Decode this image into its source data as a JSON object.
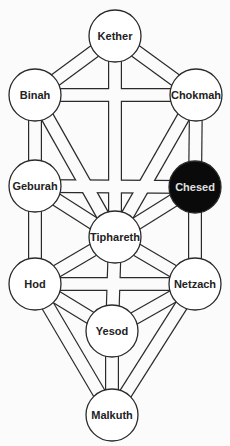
{
  "diagram": {
    "colors": {
      "background": "#fbfbfb",
      "stroke": "#2a2a2a",
      "node_fill": "#ffffff",
      "highlight_fill": "#0a0a0a",
      "highlight_text": "#e0e0e0",
      "text": "#222222"
    },
    "nodes": [
      {
        "id": "kether",
        "label": "Kether",
        "x": 115,
        "y": 36,
        "highlighted": false
      },
      {
        "id": "binah",
        "label": "Binah",
        "x": 35,
        "y": 95,
        "highlighted": false
      },
      {
        "id": "chokmah",
        "label": "Chokmah",
        "x": 196,
        "y": 95,
        "highlighted": false
      },
      {
        "id": "geburah",
        "label": "Geburah",
        "x": 35,
        "y": 186,
        "highlighted": false
      },
      {
        "id": "chesed",
        "label": "Chesed",
        "x": 195,
        "y": 187,
        "highlighted": true
      },
      {
        "id": "tiphareth",
        "label": "Tiphareth",
        "x": 115,
        "y": 237,
        "highlighted": false
      },
      {
        "id": "hod",
        "label": "Hod",
        "x": 35,
        "y": 284,
        "highlighted": false
      },
      {
        "id": "netzach",
        "label": "Netzach",
        "x": 195,
        "y": 284,
        "highlighted": false
      },
      {
        "id": "yesod",
        "label": "Yesod",
        "x": 112,
        "y": 331,
        "highlighted": false
      },
      {
        "id": "malkuth",
        "label": "Malkuth",
        "x": 112,
        "y": 415,
        "highlighted": false
      }
    ],
    "paths": [
      [
        "kether",
        "binah"
      ],
      [
        "kether",
        "chokmah"
      ],
      [
        "kether",
        "tiphareth"
      ],
      [
        "binah",
        "chokmah"
      ],
      [
        "binah",
        "geburah"
      ],
      [
        "binah",
        "tiphareth"
      ],
      [
        "chokmah",
        "chesed"
      ],
      [
        "chokmah",
        "tiphareth"
      ],
      [
        "geburah",
        "chesed"
      ],
      [
        "geburah",
        "tiphareth"
      ],
      [
        "geburah",
        "hod"
      ],
      [
        "chesed",
        "tiphareth"
      ],
      [
        "chesed",
        "netzach"
      ],
      [
        "tiphareth",
        "hod"
      ],
      [
        "tiphareth",
        "netzach"
      ],
      [
        "tiphareth",
        "yesod"
      ],
      [
        "hod",
        "netzach"
      ],
      [
        "hod",
        "yesod"
      ],
      [
        "hod",
        "malkuth"
      ],
      [
        "netzach",
        "yesod"
      ],
      [
        "netzach",
        "malkuth"
      ],
      [
        "yesod",
        "malkuth"
      ]
    ],
    "node_radius": 26,
    "path_width": 14
  }
}
